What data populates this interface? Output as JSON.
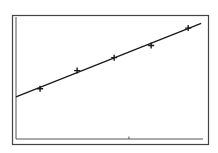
{
  "chart_data": {
    "type": "scatter",
    "title": "",
    "xlabel": "",
    "ylabel": "",
    "grid": false,
    "legend": "none",
    "x_tick_marks": [
      3.4
    ],
    "xlim": [
      0.35,
      5.4
    ],
    "ylim": [
      0,
      3.3
    ],
    "series": [
      {
        "name": "data points",
        "marker": "+",
        "x": [
          1,
          2,
          3,
          4,
          5
        ],
        "y": [
          1.36,
          1.85,
          2.2,
          2.53,
          3.0
        ]
      },
      {
        "name": "regression line",
        "style": "line",
        "x": [
          0.35,
          5.35
        ],
        "y": [
          1.14,
          3.13
        ]
      }
    ]
  },
  "colors": {
    "background": "#ffffff",
    "frame": "#444444",
    "axes": "#555555",
    "line": "#1a1a1a",
    "marker": "#1a1a1a"
  }
}
